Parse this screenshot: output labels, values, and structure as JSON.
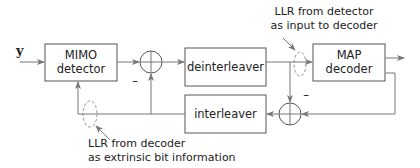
{
  "diagram": {
    "input_label": "y",
    "blocks": {
      "mimo_detector": {
        "line1": "MIMO",
        "line2": "detector"
      },
      "deinterleaver": {
        "label": "deinterleaver"
      },
      "map_decoder": {
        "line1": "MAP",
        "line2": "decoder"
      },
      "interleaver": {
        "label": "interleaver"
      }
    },
    "adders": {
      "adder_top": {
        "sign": "–"
      },
      "adder_bottom": {
        "sign": "–"
      }
    },
    "annotations": {
      "detector_llr": {
        "line1": "LLR from detector",
        "line2": "as input to decoder"
      },
      "decoder_llr": {
        "line1": "LLR from decoder",
        "line2": "as extrinsic bit information"
      }
    }
  }
}
